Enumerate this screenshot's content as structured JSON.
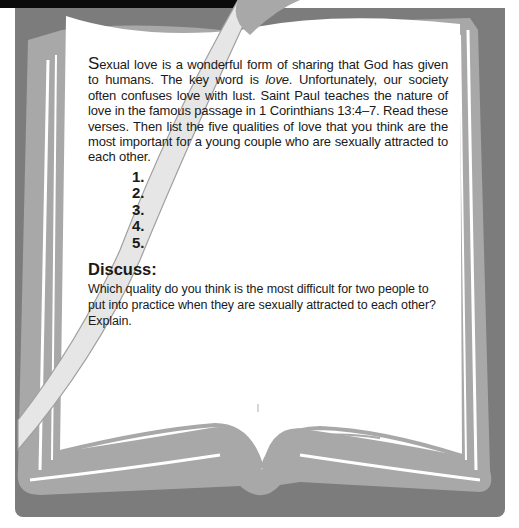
{
  "activity": {
    "intro": {
      "dropcap": "S",
      "text_before_em": "exual love is a wonderful form of sharing that God has given to humans. The key word is ",
      "em": "love",
      "text_after_em": ". Unfortunately, our society often confuses love with lust. Saint Paul teaches the nature of love in the famous passage in 1 Corinthians 13:4–7. Read these verses. Then list the five qualities of love that you think are the most important for a young couple who are sexually attracted to each other."
    },
    "list_items": [
      "1.",
      "2.",
      "3.",
      "4.",
      "5."
    ],
    "discuss": {
      "title": "Discuss:",
      "body": "Which quality do you think is the most difficult for two people to put into practice when they are sexually attracted to each other? Explain."
    }
  },
  "colors": {
    "top_bar": "#0a0a0a",
    "background_panel": "#7c7c7c",
    "book_edge": "#a8a8a8",
    "page": "#ffffff",
    "ribbon": "#e6e6e6",
    "text": "#1a1a1a"
  }
}
